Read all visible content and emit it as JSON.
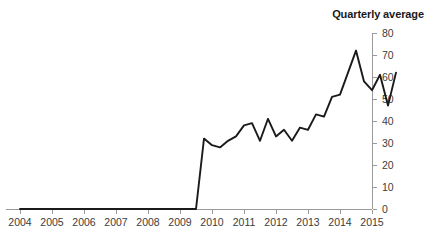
{
  "chart_data": {
    "type": "line",
    "title": "Quarterly average",
    "xlabel": "",
    "ylabel": "",
    "ylim": [
      0,
      80
    ],
    "xlim": [
      2004.0,
      2016.0
    ],
    "grid": false,
    "legend": false,
    "legend_position": "none",
    "y_ticks": [
      0,
      10,
      20,
      30,
      40,
      50,
      60,
      70,
      80
    ],
    "y_tick_labels": [
      "0",
      "10",
      "20",
      "30",
      "40",
      "50",
      "60",
      "70",
      "80"
    ],
    "y_axis_position": "right",
    "x_ticks": [
      2004,
      2005,
      2006,
      2007,
      2008,
      2009,
      2010,
      2011,
      2012,
      2013,
      2014,
      2015
    ],
    "x_tick_labels": [
      "2004",
      "2005",
      "2006",
      "2007",
      "2008",
      "2009",
      "2010",
      "2011",
      "2012",
      "2013",
      "2014",
      "2015"
    ],
    "series": [
      {
        "name": "Quarterly average",
        "color": "#1a1a1a",
        "x": [
          2004.0,
          2004.25,
          2004.5,
          2004.75,
          2005.0,
          2005.25,
          2005.5,
          2005.75,
          2006.0,
          2006.25,
          2006.5,
          2006.75,
          2007.0,
          2007.25,
          2007.5,
          2007.75,
          2008.0,
          2008.25,
          2008.5,
          2008.75,
          2009.0,
          2009.25,
          2009.5,
          2009.75,
          2010.0,
          2010.25,
          2010.5,
          2010.75,
          2011.0,
          2011.25,
          2011.5,
          2011.75,
          2012.0,
          2012.25,
          2012.5,
          2012.75,
          2013.0,
          2013.25,
          2013.5,
          2013.75,
          2014.0,
          2014.25,
          2014.5,
          2014.75,
          2015.0,
          2015.25,
          2015.5,
          2015.75
        ],
        "values": [
          0,
          0,
          0,
          0,
          0,
          0,
          0,
          0,
          0,
          0,
          0,
          0,
          0,
          0,
          0,
          0,
          0,
          0,
          0,
          0,
          0,
          0,
          0,
          32,
          29,
          28,
          31,
          33,
          38,
          39,
          31,
          41,
          33,
          36,
          31,
          37,
          36,
          43,
          42,
          51,
          52,
          62,
          72,
          58,
          54,
          61,
          47,
          62
        ]
      }
    ],
    "annotations": [],
    "final_value": 46,
    "peak_value": 72,
    "peak_x": "2014.5",
    "zero_period_end": "2009.5"
  },
  "axes": {
    "y_axis_name": "value-axis-right",
    "x_axis_name": "year-axis-bottom"
  }
}
